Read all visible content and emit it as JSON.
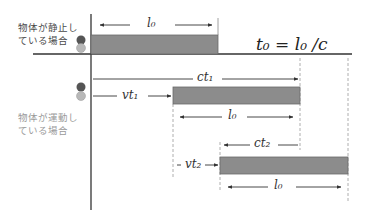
{
  "rest_case": {
    "label_line1": "物体が静止し",
    "label_line2": "ている場合",
    "length_label": "l₀",
    "formula": "t₀ = l₀ /c"
  },
  "moving_case": {
    "label_line1": "物体が運動し",
    "label_line2": "ている場合",
    "ct1_label": "ct₁",
    "vt1_label": "vt₁",
    "l0_label_1": "l₀",
    "ct2_label": "ct₂",
    "vt2_label": "vt₂",
    "l0_label_2": "l₀"
  },
  "colors": {
    "bar_fill": "#8c8c8c",
    "bar_border": "#6a6a6a",
    "axis": "#333333",
    "dashed": "#9a9a9a",
    "ball_dark": "#555555",
    "ball_light": "#b8b8b8"
  }
}
